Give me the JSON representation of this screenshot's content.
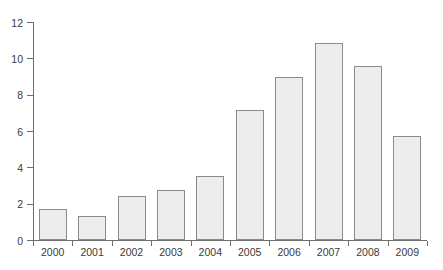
{
  "chart_data": {
    "type": "bar",
    "title": "",
    "subtitle": "",
    "xlabel": "",
    "ylabel": "",
    "categories": [
      "2000",
      "2001",
      "2002",
      "2003",
      "2004",
      "2005",
      "2006",
      "2007",
      "2008",
      "2009"
    ],
    "values": [
      1.7,
      1.3,
      2.4,
      2.75,
      3.5,
      7.15,
      9.0,
      10.85,
      9.6,
      5.75
    ],
    "ylim": [
      0,
      12
    ],
    "yticks": [
      0,
      2,
      4,
      6,
      8,
      10,
      12
    ],
    "ytick_labels": [
      "0",
      "2",
      "4",
      "6",
      "8",
      "10",
      "12"
    ],
    "xtick_labels": [
      "2000",
      "2001",
      "2002",
      "2003",
      "2004",
      "2005",
      "2006",
      "2007",
      "2008",
      "2009"
    ],
    "grid": false,
    "legend": null,
    "legend_position": "none",
    "annotations": [],
    "series": [
      {
        "name": "",
        "values": [
          1.7,
          1.3,
          2.4,
          2.75,
          3.5,
          7.15,
          9.0,
          10.85,
          9.6,
          5.75
        ]
      }
    ]
  },
  "style": {
    "bar_fill": "#ededed",
    "bar_border": "#8a8a8a",
    "axis_color": "#6f6f6f",
    "text_color": "#3a3a3a",
    "background": "#ffffff"
  }
}
